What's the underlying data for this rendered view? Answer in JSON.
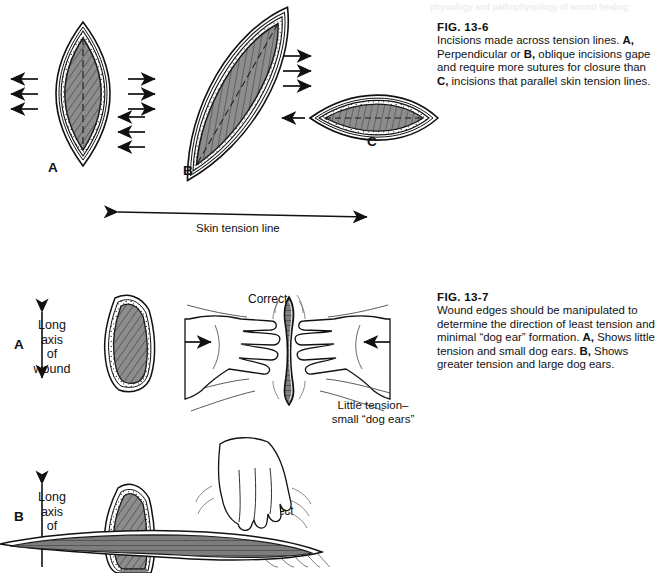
{
  "page": {
    "background": "#ffffff",
    "cut_off_header": "physiology and pathophysiology of wound healing"
  },
  "figures": [
    {
      "id": "fig-13-6",
      "number": "FIG. 13-6",
      "caption_parts": [
        {
          "text": "Incisions made across tension lines. ",
          "bold": false
        },
        {
          "text": "A,",
          "bold": true
        },
        {
          "text": " Perpendicular or ",
          "bold": false
        },
        {
          "text": "B,",
          "bold": true
        },
        {
          "text": " oblique incisions gape and require more sutures for closure than ",
          "bold": false
        },
        {
          "text": "C,",
          "bold": true
        },
        {
          "text": " incisions that parallel skin tension lines.",
          "bold": false
        }
      ],
      "panels": [
        {
          "letter": "A",
          "orientation": "vertical",
          "description": "perpendicular incision, wide gape"
        },
        {
          "letter": "B",
          "orientation": "oblique",
          "description": "oblique incision, gapes"
        },
        {
          "letter": "C",
          "orientation": "horizontal",
          "description": "incision parallel to skin tension lines"
        }
      ],
      "axis_label": "Skin tension line",
      "arrow_groups": [
        {
          "panel": "A",
          "side": "left",
          "direction": "left",
          "count": 3
        },
        {
          "panel": "A",
          "side": "right",
          "direction": "right",
          "count": 3
        },
        {
          "panel": "B",
          "side": "left",
          "direction": "left",
          "count": 3
        },
        {
          "panel": "B",
          "side": "right",
          "direction": "right",
          "count": 3
        },
        {
          "panel": "C",
          "side": "left",
          "direction": "left",
          "count": 1
        }
      ]
    },
    {
      "id": "fig-13-7",
      "number": "FIG. 13-7",
      "caption_parts": [
        {
          "text": "Wound edges should be manipulated to determine the direction of least tension and minimal “dog ear” formation. ",
          "bold": false
        },
        {
          "text": "A,",
          "bold": true
        },
        {
          "text": " Shows little tension and small dog ears. ",
          "bold": false
        },
        {
          "text": "B,",
          "bold": true
        },
        {
          "text": " Shows greater tension and large dog ears.",
          "bold": false
        }
      ],
      "panels": [
        {
          "letter": "A",
          "axis_label_lines": [
            "Long",
            "axis",
            "of",
            "wound"
          ],
          "status_label": "Correct",
          "result_label_lines": [
            "Little tension–",
            "small “dog ears”"
          ],
          "hands": "two hands pressing inward horizontally",
          "arrows": [
            {
              "direction": "right"
            },
            {
              "direction": "left"
            }
          ]
        },
        {
          "letter": "B",
          "axis_label_lines": [
            "Long",
            "axis",
            "of",
            "wound"
          ],
          "status_label": "Incorrect",
          "result_label_lines": [],
          "hands": "one hand pressing downward",
          "arrows": [
            {
              "direction": "down"
            }
          ]
        }
      ]
    }
  ],
  "colors": {
    "ink": "#111111",
    "wound_fill": "#8a8a8a",
    "wound_fill_dark": "#6f6f6f",
    "skin_line": "#222222",
    "paper": "#ffffff"
  }
}
